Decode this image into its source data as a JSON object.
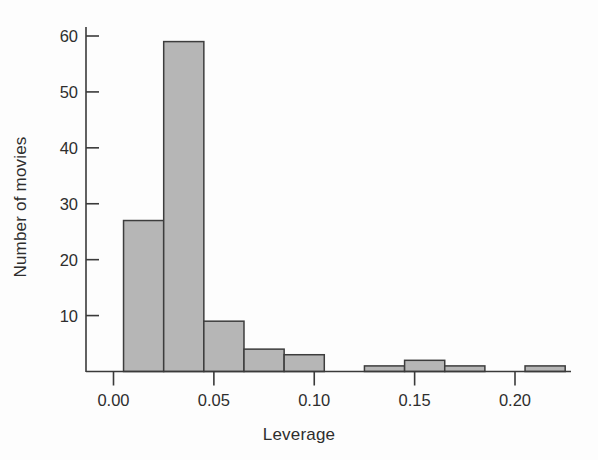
{
  "chart_data": {
    "type": "bar",
    "subtype": "histogram",
    "title": "",
    "xlabel": "Leverage",
    "ylabel": "Number of movies",
    "xlim": [
      0.0,
      0.23
    ],
    "ylim": [
      0,
      60
    ],
    "grid": false,
    "legend": null,
    "bin_width": 0.02,
    "xticks": [
      0.0,
      0.05,
      0.1,
      0.15,
      0.2
    ],
    "xtick_labels": [
      "0.00",
      "0.05",
      "0.10",
      "0.15",
      "0.20"
    ],
    "yticks": [
      10,
      20,
      30,
      40,
      50,
      60
    ],
    "ytick_labels": [
      "10",
      "20",
      "30",
      "40",
      "50",
      "60"
    ],
    "bars": [
      {
        "bin_start": 0.005,
        "bin_end": 0.025,
        "value": 27
      },
      {
        "bin_start": 0.025,
        "bin_end": 0.045,
        "value": 59
      },
      {
        "bin_start": 0.045,
        "bin_end": 0.065,
        "value": 9
      },
      {
        "bin_start": 0.065,
        "bin_end": 0.085,
        "value": 4
      },
      {
        "bin_start": 0.085,
        "bin_end": 0.105,
        "value": 3
      },
      {
        "bin_start": 0.125,
        "bin_end": 0.145,
        "value": 1
      },
      {
        "bin_start": 0.145,
        "bin_end": 0.165,
        "value": 2
      },
      {
        "bin_start": 0.165,
        "bin_end": 0.185,
        "value": 1
      },
      {
        "bin_start": 0.205,
        "bin_end": 0.225,
        "value": 1
      }
    ],
    "colors": {
      "bar_fill": "#b6b6b6",
      "bar_stroke": "#3d3d3d",
      "axis": "#3a3a3a",
      "text": "#2e2e2e",
      "background": "#fdfdfd"
    }
  }
}
